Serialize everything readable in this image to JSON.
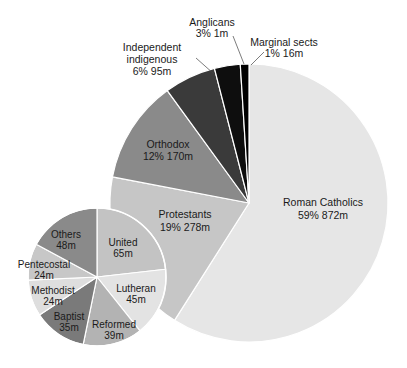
{
  "chart_data": [
    {
      "type": "pie",
      "title": "",
      "name": "Christian denominations",
      "center": [
        249,
        203
      ],
      "radius": 139,
      "start_angle_deg": 0,
      "direction": "clockwise",
      "slices": [
        {
          "label": "Roman Catholics",
          "percent": 59,
          "value_m": 872,
          "pct_text": "59%",
          "val_text": "872m",
          "color": "#e6e6e6"
        },
        {
          "label": "Protestants",
          "percent": 19,
          "value_m": 278,
          "pct_text": "19%",
          "val_text": "278m",
          "color": "#c6c6c6"
        },
        {
          "label": "Orthodox",
          "percent": 12,
          "value_m": 170,
          "pct_text": "12%",
          "val_text": "170m",
          "color": "#8a8a8a"
        },
        {
          "label": "Independent indigenous",
          "percent": 6,
          "value_m": 95,
          "pct_text": "6%",
          "val_text": "95m",
          "color": "#3a3a3a"
        },
        {
          "label": "Anglicans",
          "percent": 3,
          "value_m": 1,
          "pct_text": "3%",
          "val_text": "1m",
          "color": "#0e0e0e"
        },
        {
          "label": "Marginal sects",
          "percent": 1,
          "value_m": 16,
          "pct_text": "1%",
          "val_text": "16m",
          "color": "#000000"
        }
      ]
    },
    {
      "type": "pie",
      "title": "",
      "name": "Protestants breakdown",
      "center": [
        97,
        277
      ],
      "radius": 69,
      "start_angle_deg": 0,
      "direction": "clockwise",
      "slices": [
        {
          "label": "United",
          "value_m": 65,
          "val_text": "65m",
          "color": "#c3c3c3"
        },
        {
          "label": "Lutheran",
          "value_m": 45,
          "val_text": "45m",
          "color": "#e3e3e3"
        },
        {
          "label": "Reformed",
          "value_m": 39,
          "val_text": "39m",
          "color": "#b3b3b3"
        },
        {
          "label": "Baptist",
          "value_m": 35,
          "val_text": "35m",
          "color": "#7a7a7a"
        },
        {
          "label": "Methodist",
          "value_m": 24,
          "val_text": "24m",
          "color": "#dedede"
        },
        {
          "label": "Pentecostal",
          "value_m": 24,
          "val_text": "24m",
          "color": "#c7c7c7"
        },
        {
          "label": "Others",
          "value_m": 48,
          "val_text": "48m",
          "color": "#8a8a8a"
        }
      ]
    }
  ],
  "labels": {
    "roman_catholics": {
      "name": "Roman Catholics",
      "stat": "59%   872m"
    },
    "protestants": {
      "name": "Protestants",
      "stat": "19%   278m"
    },
    "orthodox": {
      "name": "Orthodox",
      "stat": "12%   170m"
    },
    "independent": {
      "name1": "Independent",
      "name2": "indigenous",
      "stat": "6%   95m"
    },
    "anglicans": {
      "name": "Anglicans",
      "stat": "3%   1m"
    },
    "marginal": {
      "name": "Marginal sects",
      "stat": "1%   16m"
    },
    "united": {
      "name": "United",
      "val": "65m"
    },
    "lutheran": {
      "name": "Lutheran",
      "val": "45m"
    },
    "reformed": {
      "name": "Reformed",
      "val": "39m"
    },
    "baptist": {
      "name": "Baptist",
      "val": "35m"
    },
    "methodist": {
      "name": "Methodist",
      "val": "24m"
    },
    "pentecostal": {
      "name": "Pentecostal",
      "val": "24m"
    },
    "others": {
      "name": "Others",
      "val": "48m"
    }
  }
}
